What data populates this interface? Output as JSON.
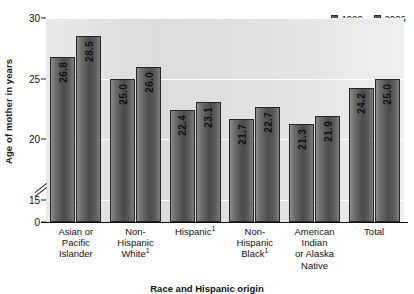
{
  "chart_data": {
    "type": "bar",
    "title": "",
    "xlabel": "Race and Hispanic origin",
    "ylabel": "Age of mother in years",
    "ylim": [
      0,
      30
    ],
    "yticks": [
      0,
      15,
      20,
      25,
      30
    ],
    "ytick_labels": [
      "0",
      "15",
      "20",
      "25",
      "30"
    ],
    "axis_break": true,
    "grid": true,
    "legend_position": "top-right",
    "categories": [
      "Asian or Pacific Islander",
      "Non-Hispanic White",
      "Hispanic",
      "Non-Hispanic Black",
      "American Indian or Alaska Native",
      "Total"
    ],
    "category_lines": [
      [
        "Asian or",
        "Pacific",
        "Islander"
      ],
      [
        "Non-",
        "Hispanic",
        "White"
      ],
      [
        "Hispanic"
      ],
      [
        "Non-",
        "Hispanic",
        "Black"
      ],
      [
        "American",
        "Indian",
        "or Alaska",
        "Native"
      ],
      [
        "Total"
      ]
    ],
    "category_footnotes": [
      "",
      "1",
      "1",
      "1",
      "",
      ""
    ],
    "series": [
      {
        "name": "1990",
        "values": [
          26.8,
          25.0,
          22.4,
          21.7,
          21.3,
          24.2
        ]
      },
      {
        "name": "2006",
        "values": [
          28.5,
          26.0,
          23.1,
          22.7,
          21.9,
          25.0
        ]
      }
    ],
    "value_labels": [
      [
        "26.8",
        "28.5"
      ],
      [
        "25.0",
        "26.0"
      ],
      [
        "22.4",
        "23.1"
      ],
      [
        "21.7",
        "22.7"
      ],
      [
        "21.3",
        "21.9"
      ],
      [
        "24.2",
        "25.0"
      ]
    ]
  },
  "legend": {
    "items": [
      {
        "label": "1990",
        "color": "#4a4a4a"
      },
      {
        "label": "2006",
        "color": "#4a4a4a"
      }
    ]
  },
  "axes": {
    "y_title": "Age of mother in years",
    "x_title": "Race and Hispanic origin"
  }
}
